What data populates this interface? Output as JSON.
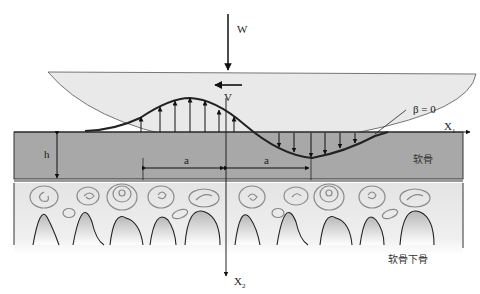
{
  "diagram": {
    "type": "articular-cartilage-lubrication-schematic",
    "labels": {
      "load": "W",
      "velocity": "V",
      "beta": "β = 0",
      "axis_x1_base": "X",
      "axis_x1_sub": "1",
      "axis_x2_base": "X",
      "axis_x2_sub": "2",
      "thickness": "h",
      "half_width_left": "a",
      "half_width_right": "a",
      "cartilage": "软骨",
      "subchondral_bone": "软骨下骨"
    },
    "colors": {
      "upper_body": "#e8e8e8",
      "cartilage": "#a9a9a9",
      "bone_top": "#e6e6e6",
      "bone_bottom": "#ffffff",
      "outline": "#222222",
      "swirl": "#8a8a8a"
    }
  }
}
